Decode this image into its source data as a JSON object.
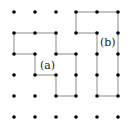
{
  "diagram": {
    "type": "lattice-polygons",
    "grid": {
      "cols": 6,
      "rows": 6,
      "x_positions": [
        14,
        35,
        56,
        76,
        97,
        118
      ],
      "y_positions": [
        12,
        33,
        54,
        75,
        96,
        117
      ],
      "dot_color": "#000000",
      "dot_radius": 1.8
    },
    "line_color": "#8a8a8a",
    "polygons": [
      {
        "id": "a",
        "label": "(a)",
        "label_pos": {
          "x": 39,
          "y": 60
        },
        "vertices": [
          [
            0,
            1
          ],
          [
            2,
            1
          ],
          [
            2,
            2
          ],
          [
            3,
            2
          ],
          [
            3,
            4
          ],
          [
            2,
            4
          ],
          [
            2,
            3
          ],
          [
            1,
            3
          ],
          [
            1,
            2
          ],
          [
            0,
            2
          ]
        ]
      },
      {
        "id": "b",
        "label": "(b)",
        "label_pos": {
          "x": 99,
          "y": 37
        },
        "vertices": [
          [
            3,
            0
          ],
          [
            5,
            0
          ],
          [
            5,
            4
          ],
          [
            4,
            4
          ],
          [
            4,
            1
          ],
          [
            3,
            1
          ]
        ]
      }
    ]
  }
}
